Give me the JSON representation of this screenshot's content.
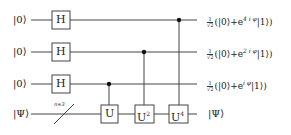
{
  "circuit": {
    "inputs": [
      "|0⟩",
      "|0⟩",
      "|0⟩",
      "|Ψ⟩"
    ],
    "register_annotation": "n=3",
    "hadamard_label": "H",
    "controlled_gates": [
      {
        "label": "U",
        "power": ""
      },
      {
        "label": "U",
        "power": "2"
      },
      {
        "label": "U",
        "power": "4"
      }
    ],
    "outputs": [
      {
        "prefix": "(|0⟩+e",
        "exponent": "4 i φ",
        "suffix": "|1⟩)"
      },
      {
        "prefix": "(|0⟩+e",
        "exponent": "2 i φ",
        "suffix": "|1⟩)"
      },
      {
        "prefix": "(|0⟩+e",
        "exponent": "i φ",
        "suffix": "|1⟩)"
      },
      {
        "state": "|Ψ⟩"
      }
    ],
    "norm_num": "1",
    "norm_den": "√2"
  }
}
